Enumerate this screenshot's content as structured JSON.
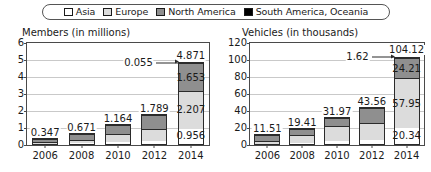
{
  "legend": {
    "items": [
      {
        "label": "Asia",
        "color": "#ffffff"
      },
      {
        "label": "Europe",
        "color": "#dcdcdc"
      },
      {
        "label": "North America",
        "color": "#8f8f8f"
      },
      {
        "label": "South America, Oceania",
        "color": "#000000"
      }
    ]
  },
  "chart_data": [
    {
      "type": "bar",
      "stacked": true,
      "title": "Members (in millions)",
      "xlabel": "",
      "ylabel": "",
      "ylim": [
        0,
        6
      ],
      "yticks": [
        0,
        1,
        2,
        3,
        4,
        5,
        6
      ],
      "grid": true,
      "legend_position": "top",
      "categories": [
        "2006",
        "2008",
        "2010",
        "2012",
        "2014"
      ],
      "series": [
        {
          "name": "Asia",
          "color": "#ffffff",
          "values": [
            0.06,
            0.1,
            0.2,
            0.25,
            0.956
          ]
        },
        {
          "name": "Europe",
          "color": "#dcdcdc",
          "values": [
            0.12,
            0.22,
            0.42,
            0.67,
            2.207
          ]
        },
        {
          "name": "North America",
          "color": "#8f8f8f",
          "values": [
            0.165,
            0.349,
            0.541,
            0.866,
            1.653
          ]
        },
        {
          "name": "South America, Oceania",
          "color": "#000000",
          "values": [
            0.002,
            0.002,
            0.003,
            0.003,
            0.055
          ]
        }
      ],
      "totals": [
        "0.347",
        "0.671",
        "1.164",
        "1.789",
        "4.871"
      ],
      "segment_labels_2014": {
        "asia": "0.956",
        "europe": "2.207",
        "north_america": "1.653",
        "south_america_oceania": "0.055"
      }
    },
    {
      "type": "bar",
      "stacked": true,
      "title": "Vehicles (in thousands)",
      "xlabel": "",
      "ylabel": "",
      "ylim": [
        0,
        120
      ],
      "yticks": [
        0,
        20,
        40,
        60,
        80,
        100,
        120
      ],
      "grid": true,
      "legend_position": "top",
      "categories": [
        "2006",
        "2008",
        "2010",
        "2012",
        "2014"
      ],
      "series": [
        {
          "name": "Asia",
          "color": "#ffffff",
          "values": [
            1.2,
            2.0,
            4.3,
            6.2,
            20.34
          ]
        },
        {
          "name": "Europe",
          "color": "#dcdcdc",
          "values": [
            4.0,
            10.0,
            17.5,
            20.0,
            57.95
          ]
        },
        {
          "name": "North America",
          "color": "#8f8f8f",
          "values": [
            6.2,
            7.3,
            10.0,
            17.2,
            24.21
          ]
        },
        {
          "name": "South America, Oceania",
          "color": "#000000",
          "values": [
            0.11,
            0.11,
            0.17,
            0.16,
            1.62
          ]
        }
      ],
      "totals": [
        "11.51",
        "19.41",
        "31.97",
        "43.56",
        "104.12"
      ],
      "segment_labels_2014": {
        "asia": "20.34",
        "europe": "57.95",
        "north_america": "24.21",
        "south_america_oceania": "1.62"
      }
    }
  ]
}
